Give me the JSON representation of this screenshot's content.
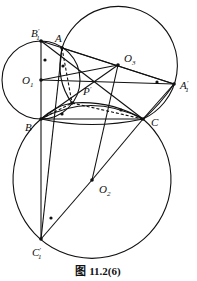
{
  "caption": "图 11.2(6)",
  "labels": {
    "B1p": "B",
    "A": "A",
    "O1": "O",
    "O3": "O",
    "A1p": "A",
    "P": "P",
    "B": "B",
    "C": "C",
    "O2": "O",
    "C1p": "C"
  },
  "subscripts": {
    "B1p": "1",
    "O1": "1",
    "O3": "3",
    "A1p": "1",
    "O2": "2",
    "C1p": "1"
  },
  "primes": {
    "B1p": "′",
    "A1p": "′",
    "P": "′",
    "C1p": "′"
  },
  "points": {
    "B1p": [
      41,
      41
    ],
    "A": [
      62,
      48
    ],
    "O1": [
      41,
      80
    ],
    "O3": [
      118,
      65
    ],
    "A1p": [
      174,
      84
    ],
    "P": [
      72,
      103
    ],
    "B": [
      41,
      119
    ],
    "C": [
      143,
      119
    ],
    "O2": [
      92,
      180
    ],
    "C1p": [
      41,
      239
    ]
  },
  "circles": [
    {
      "name": "circle-O1",
      "center": "O1",
      "r": 39
    },
    {
      "name": "circle-O3",
      "center": "O3",
      "r": 59
    },
    {
      "name": "circle-O2",
      "center": "O2",
      "r": 79
    }
  ],
  "colors": {
    "stroke": "#111111",
    "background": "#ffffff"
  }
}
